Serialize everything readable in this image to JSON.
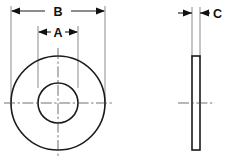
{
  "drawing": {
    "type": "engineering-drawing",
    "subject": "flat-washer",
    "views": [
      {
        "name": "front-view",
        "description": "plan view of washer showing outer and inner diameter"
      },
      {
        "name": "side-view",
        "description": "edge view of washer showing thickness"
      }
    ],
    "dimensions": [
      {
        "id": "B",
        "label": "B",
        "name": "outside-diameter",
        "view": "front-view",
        "orientation": "horizontal",
        "label_x": 58,
        "label_y": 16,
        "dim_line_y": 11,
        "left_x": 11,
        "right_x": 105,
        "gap_left_x": 45,
        "gap_right_x": 71
      },
      {
        "id": "A",
        "label": "A",
        "name": "inside-diameter",
        "view": "front-view",
        "orientation": "horizontal",
        "label_x": 58,
        "label_y": 37,
        "dim_line_y": 32,
        "left_x": 38,
        "right_x": 78,
        "gap_left_x": 51,
        "gap_right_x": 65
      },
      {
        "id": "C",
        "label": "C",
        "name": "thickness",
        "view": "side-view",
        "orientation": "horizontal",
        "label_x": 213,
        "label_y": 18,
        "dim_line_y": 13,
        "left_x": 192,
        "right_x": 200,
        "leader_outer_left_x": 178,
        "leader_outer_right_x": 210
      }
    ],
    "geometry": {
      "front_view": {
        "center_x": 58,
        "center_y": 103,
        "outer_radius": 47,
        "inner_radius": 20
      },
      "side_view": {
        "left_x": 192,
        "right_x": 200,
        "top_y": 56,
        "bottom_y": 150,
        "center_x": 196,
        "center_y": 103
      },
      "centerlines": [
        {
          "name": "front-horizontal-centerline",
          "x1": 4,
          "y1": 103,
          "x2": 112,
          "y2": 103
        },
        {
          "name": "front-vertical-centerline",
          "x1": 58,
          "y1": 48,
          "x2": 58,
          "y2": 158
        },
        {
          "name": "side-horizontal-centerline",
          "x1": 178,
          "y1": 103,
          "x2": 215,
          "y2": 103
        }
      ],
      "extension_lines": [
        {
          "name": "ext-b-left",
          "x": 11,
          "y1": 6,
          "y2": 105
        },
        {
          "name": "ext-b-right",
          "x": 105,
          "y1": 6,
          "y2": 105
        },
        {
          "name": "ext-a-left",
          "x": 38,
          "y1": 26,
          "y2": 88
        },
        {
          "name": "ext-a-right",
          "x": 78,
          "y1": 26,
          "y2": 88
        },
        {
          "name": "ext-c-left",
          "x": 192,
          "y1": 7,
          "y2": 58
        },
        {
          "name": "ext-c-right",
          "x": 200,
          "y1": 7,
          "y2": 58
        }
      ]
    },
    "colors": {
      "object_line": "#1a1a1a",
      "extension_line": "#5a5a5a",
      "center_line": "#4d4d4d",
      "arrow": "#111111",
      "text": "#111111",
      "background": "#ffffff"
    }
  }
}
